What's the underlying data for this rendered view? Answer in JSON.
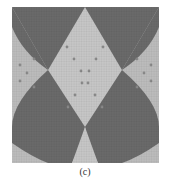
{
  "figure": {
    "caption": "(c)",
    "colors": {
      "background_light": "#b9b9b9",
      "diamond_dark": "#6a6a6a",
      "diamond_light": "#c4c4c4",
      "stitch_grid": "#8d8d8d",
      "dot": "#8a8a8a"
    }
  }
}
